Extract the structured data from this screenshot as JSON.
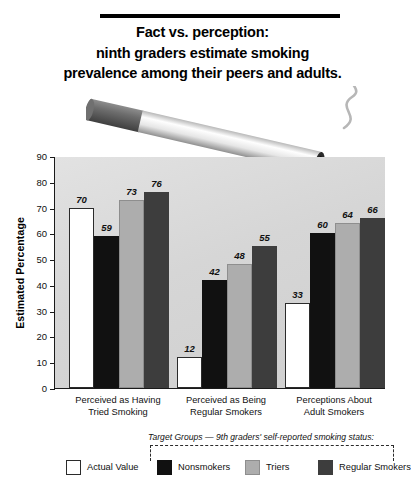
{
  "title": {
    "line1": "Fact vs. perception:",
    "line2": "ninth graders estimate smoking",
    "line3": "prevalence among their peers and adults."
  },
  "legend": {
    "caption": "Target Groups — 9th graders' self-reported smoking status:",
    "items": [
      {
        "label": "Actual Value",
        "color": "#ffffff"
      },
      {
        "label": "Nonsmokers",
        "color": "#111111"
      },
      {
        "label": "Triers",
        "color": "#adadad"
      },
      {
        "label": "Regular Smokers",
        "color": "#3d3d3d"
      }
    ]
  },
  "chart_data": {
    "type": "bar",
    "title": "Fact vs. perception: ninth graders estimate smoking prevalence among their peers and adults.",
    "xlabel": "",
    "ylabel": "Estimated Percentage",
    "ylim": [
      0,
      90
    ],
    "yticks": [
      0,
      10,
      20,
      30,
      40,
      50,
      60,
      70,
      80,
      90
    ],
    "ytick_labels": [
      "0",
      "10",
      "20",
      "30",
      "40",
      "50",
      "60",
      "70",
      "80",
      "90"
    ],
    "grid": false,
    "legend_position": "bottom",
    "categories": [
      "Perceived as Having Tried Smoking",
      "Perceived as Being Regular Smokers",
      "Perceptions About Adult Smokers"
    ],
    "category_lines": [
      [
        "Perceived as Having",
        "Tried Smoking"
      ],
      [
        "Perceived as Being",
        "Regular Smokers"
      ],
      [
        "Perceptions About",
        "Adult Smokers"
      ]
    ],
    "series": [
      {
        "name": "Actual Value",
        "color": "#ffffff",
        "values": [
          70,
          12,
          33
        ]
      },
      {
        "name": "Nonsmokers",
        "color": "#111111",
        "values": [
          59,
          42,
          60
        ]
      },
      {
        "name": "Triers",
        "color": "#adadad",
        "values": [
          73,
          48,
          64
        ]
      },
      {
        "name": "Regular Smokers",
        "color": "#3d3d3d",
        "values": [
          76,
          55,
          66
        ]
      }
    ]
  }
}
